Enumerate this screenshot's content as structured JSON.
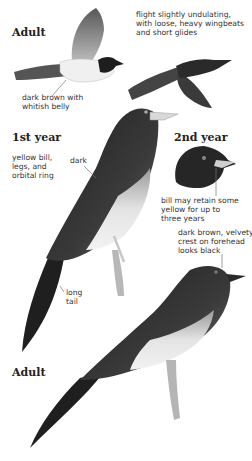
{
  "plate": {
    "subject": "Rufous Treepie / dark treepie illustration plate",
    "headings": {
      "adult_flight": "Adult",
      "first_year": "1st year",
      "second_year": "2nd year",
      "adult_perched": "Adult"
    },
    "notes": {
      "belly": [
        "dark brown with",
        "whitish belly"
      ],
      "flight": [
        "flight slightly undulating,",
        "with loose, heavy wingbeats",
        "and short glides"
      ],
      "first_year_bill": [
        "yellow bill,",
        "legs, and",
        "orbital ring"
      ],
      "dark": [
        "dark"
      ],
      "second_year_bill": [
        "bill may retain some",
        "yellow for up to",
        "three years"
      ],
      "long_tail": [
        "long",
        "tail"
      ],
      "crest": [
        "dark brown, velvety",
        "crest on forehead",
        "looks black"
      ]
    },
    "colors": {
      "plumage_dark": "#2a2a2a",
      "plumage_mid": "#555555",
      "belly": "#e6e6e6",
      "bill_pale": "#d8d8d8",
      "leader_line": "#777777",
      "text": "#333333"
    }
  }
}
